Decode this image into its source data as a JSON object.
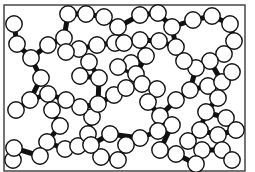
{
  "figure": {
    "width": 255,
    "height": 172,
    "frame": {
      "x": 4,
      "y": 5,
      "w": 241,
      "h": 166,
      "color": "#3a3a3a"
    },
    "particle_radius": 8.2,
    "particle_stroke": "#111111",
    "particle_fill": "#ffffff",
    "neck_width": 5,
    "particles": [
      [
        14,
        24
      ],
      [
        17,
        44
      ],
      [
        31,
        58
      ],
      [
        41,
        78
      ],
      [
        48,
        45
      ],
      [
        64,
        38
      ],
      [
        68,
        14
      ],
      [
        86,
        14
      ],
      [
        104,
        17
      ],
      [
        118,
        27
      ],
      [
        115,
        43
      ],
      [
        97,
        45
      ],
      [
        79,
        49
      ],
      [
        66,
        52
      ],
      [
        89,
        62
      ],
      [
        99,
        78
      ],
      [
        80,
        76
      ],
      [
        140,
        15
      ],
      [
        158,
        13
      ],
      [
        172,
        27
      ],
      [
        176,
        47
      ],
      [
        159,
        41
      ],
      [
        140,
        40
      ],
      [
        124,
        43
      ],
      [
        146,
        56
      ],
      [
        131,
        63
      ],
      [
        193,
        20
      ],
      [
        212,
        16
      ],
      [
        230,
        24
      ],
      [
        234,
        41
      ],
      [
        224,
        54
      ],
      [
        210,
        61
      ],
      [
        196,
        68
      ],
      [
        184,
        61
      ],
      [
        118,
        67
      ],
      [
        136,
        74
      ],
      [
        16,
        110
      ],
      [
        30,
        100
      ],
      [
        48,
        94
      ],
      [
        52,
        110
      ],
      [
        60,
        126
      ],
      [
        47,
        142
      ],
      [
        65,
        149
      ],
      [
        78,
        146
      ],
      [
        88,
        134
      ],
      [
        92,
        117
      ],
      [
        80,
        107
      ],
      [
        66,
        100
      ],
      [
        13,
        160
      ],
      [
        40,
        156
      ],
      [
        14,
        148
      ],
      [
        98,
        104
      ],
      [
        114,
        95
      ],
      [
        126,
        88
      ],
      [
        142,
        84
      ],
      [
        157,
        89
      ],
      [
        148,
        102
      ],
      [
        160,
        116
      ],
      [
        172,
        125
      ],
      [
        158,
        131
      ],
      [
        140,
        138
      ],
      [
        126,
        145
      ],
      [
        118,
        160
      ],
      [
        101,
        157
      ],
      [
        110,
        134
      ],
      [
        91,
        145
      ],
      [
        176,
        100
      ],
      [
        190,
        90
      ],
      [
        208,
        86
      ],
      [
        222,
        82
      ],
      [
        232,
        72
      ],
      [
        218,
        98
      ],
      [
        206,
        112
      ],
      [
        226,
        118
      ],
      [
        236,
        130
      ],
      [
        218,
        135
      ],
      [
        200,
        130
      ],
      [
        188,
        141
      ],
      [
        202,
        150
      ],
      [
        222,
        150
      ],
      [
        232,
        160
      ],
      [
        196,
        164
      ],
      [
        176,
        154
      ],
      [
        160,
        150
      ]
    ],
    "necks": [
      [
        0,
        1
      ],
      [
        1,
        2
      ],
      [
        2,
        3
      ],
      [
        2,
        4
      ],
      [
        4,
        5
      ],
      [
        5,
        6
      ],
      [
        6,
        7
      ],
      [
        7,
        8
      ],
      [
        8,
        9
      ],
      [
        9,
        10
      ],
      [
        10,
        11
      ],
      [
        11,
        12
      ],
      [
        12,
        13
      ],
      [
        13,
        5
      ],
      [
        12,
        14
      ],
      [
        14,
        15
      ],
      [
        15,
        16
      ],
      [
        16,
        14
      ],
      [
        9,
        17
      ],
      [
        17,
        18
      ],
      [
        18,
        19
      ],
      [
        19,
        20
      ],
      [
        20,
        21
      ],
      [
        21,
        22
      ],
      [
        22,
        23
      ],
      [
        23,
        10
      ],
      [
        22,
        24
      ],
      [
        24,
        25
      ],
      [
        19,
        26
      ],
      [
        26,
        27
      ],
      [
        27,
        28
      ],
      [
        28,
        29
      ],
      [
        29,
        30
      ],
      [
        30,
        31
      ],
      [
        31,
        32
      ],
      [
        32,
        33
      ],
      [
        33,
        20
      ],
      [
        25,
        34
      ],
      [
        34,
        35
      ],
      [
        35,
        24
      ],
      [
        3,
        37
      ],
      [
        36,
        37
      ],
      [
        37,
        38
      ],
      [
        38,
        39
      ],
      [
        39,
        40
      ],
      [
        40,
        41
      ],
      [
        41,
        42
      ],
      [
        42,
        43
      ],
      [
        43,
        44
      ],
      [
        44,
        45
      ],
      [
        45,
        46
      ],
      [
        46,
        47
      ],
      [
        47,
        38
      ],
      [
        48,
        50
      ],
      [
        50,
        49
      ],
      [
        41,
        49
      ],
      [
        15,
        51
      ],
      [
        51,
        52
      ],
      [
        52,
        53
      ],
      [
        53,
        54
      ],
      [
        54,
        55
      ],
      [
        55,
        56
      ],
      [
        56,
        57
      ],
      [
        57,
        58
      ],
      [
        58,
        59
      ],
      [
        59,
        60
      ],
      [
        60,
        61
      ],
      [
        61,
        62
      ],
      [
        62,
        63
      ],
      [
        63,
        65
      ],
      [
        65,
        64
      ],
      [
        64,
        60
      ],
      [
        46,
        51
      ],
      [
        35,
        54
      ],
      [
        57,
        66
      ],
      [
        66,
        67
      ],
      [
        67,
        68
      ],
      [
        68,
        69
      ],
      [
        69,
        70
      ],
      [
        68,
        71
      ],
      [
        71,
        72
      ],
      [
        72,
        73
      ],
      [
        73,
        74
      ],
      [
        74,
        75
      ],
      [
        75,
        76
      ],
      [
        76,
        77
      ],
      [
        77,
        78
      ],
      [
        78,
        79
      ],
      [
        79,
        80
      ],
      [
        78,
        81
      ],
      [
        81,
        82
      ],
      [
        82,
        83
      ],
      [
        83,
        58
      ],
      [
        72,
        76
      ],
      [
        32,
        67
      ],
      [
        31,
        69
      ]
    ]
  }
}
